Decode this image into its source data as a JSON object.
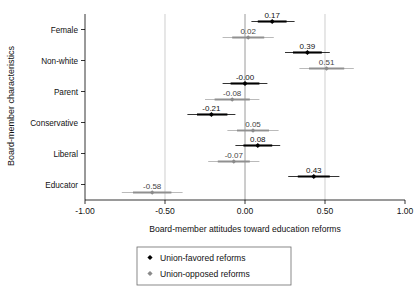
{
  "chart_data": {
    "type": "scatter",
    "title": "",
    "xlabel": "Board-member attitudes toward education reforms",
    "ylabel": "Board-member characteristics",
    "xlim": [
      -1.0,
      1.0
    ],
    "xticks": [
      -1.0,
      -0.5,
      0.0,
      0.5,
      1.0
    ],
    "xticklabels": [
      "-1.00",
      "-0.50",
      "0.00",
      "0.50",
      "1.00"
    ],
    "grid": "vertical gridlines at -0.50, 0.00, 0.50",
    "zero_reference_line": 0.0,
    "legend_position": "below plot, centered",
    "categories": [
      "Female",
      "Non-white",
      "Parent",
      "Conservative",
      "Liberal",
      "Educator"
    ],
    "series": [
      {
        "name": "Union-favored reforms",
        "color": "#000000",
        "marker": "diamond",
        "values": [
          0.17,
          0.39,
          -0.0,
          -0.21,
          0.08,
          0.43
        ],
        "labels": [
          "0.17",
          "0.39",
          "-0.00",
          "-0.21",
          "0.08",
          "0.43"
        ],
        "ci_inner": [
          [
            0.08,
            0.26
          ],
          [
            0.3,
            0.48
          ],
          [
            -0.09,
            0.09
          ],
          [
            -0.3,
            -0.11
          ],
          [
            -0.01,
            0.17
          ],
          [
            0.33,
            0.53
          ]
        ],
        "ci_outer": [
          [
            0.04,
            0.31
          ],
          [
            0.25,
            0.53
          ],
          [
            -0.14,
            0.14
          ],
          [
            -0.36,
            -0.06
          ],
          [
            -0.06,
            0.22
          ],
          [
            0.27,
            0.59
          ]
        ]
      },
      {
        "name": "Union-opposed reforms",
        "color": "#8a8a8a",
        "marker": "diamond",
        "values": [
          0.02,
          0.51,
          -0.08,
          0.05,
          -0.07,
          -0.58
        ],
        "labels": [
          "0.02",
          "0.51",
          "-0.08",
          "0.05",
          "-0.07",
          "-0.58"
        ],
        "ci_inner": [
          [
            -0.08,
            0.12
          ],
          [
            0.4,
            0.62
          ],
          [
            -0.19,
            0.03
          ],
          [
            -0.05,
            0.15
          ],
          [
            -0.17,
            0.03
          ],
          [
            -0.7,
            -0.46
          ]
        ],
        "ci_outer": [
          [
            -0.14,
            0.18
          ],
          [
            0.34,
            0.68
          ],
          [
            -0.25,
            0.09
          ],
          [
            -0.11,
            0.21
          ],
          [
            -0.23,
            0.09
          ],
          [
            -0.77,
            -0.39
          ]
        ]
      }
    ]
  },
  "legend": {
    "entries": [
      {
        "label": "Union-favored reforms",
        "marker": "diamond-black"
      },
      {
        "label": "Union-opposed reforms",
        "marker": "diamond-gray"
      }
    ]
  },
  "axes": {
    "y_title": "Board-member characteristics",
    "x_title": "Board-member attitudes toward education reforms"
  }
}
